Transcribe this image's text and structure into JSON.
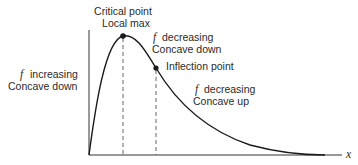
{
  "diagram": {
    "colors": {
      "curve": "#1a1a1a",
      "axis": "#333333",
      "dashed": "#555555",
      "text": "#2a2a2a",
      "background": "#ffffff"
    },
    "axis": {
      "x_label": "x"
    },
    "points": {
      "critical": {
        "line1": "Critical point",
        "line2": "Local max",
        "px": 123,
        "py": 36
      },
      "inflection": {
        "label": "Inflection point",
        "px": 156,
        "py": 68
      }
    },
    "regions": {
      "left": {
        "f_symbol": "f",
        "line1": "increasing",
        "line2": "Concave down"
      },
      "middle": {
        "f_symbol": "f",
        "line1": "decreasing",
        "line2": "Concave down"
      },
      "right": {
        "f_symbol": "f",
        "line1": "decreasing",
        "line2": "Concave up"
      }
    }
  }
}
